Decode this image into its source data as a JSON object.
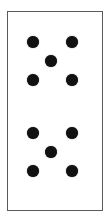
{
  "dice": [
    {
      "id": "top",
      "value": 5,
      "pip_color": "#111111",
      "border_color": "#5a5a5a"
    },
    {
      "id": "bottom",
      "value": 5,
      "pip_color": "#111111",
      "border_color": "#5a5a5a"
    }
  ]
}
